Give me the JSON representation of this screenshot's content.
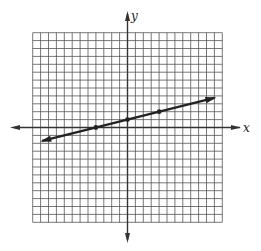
{
  "chart_data": {
    "type": "line",
    "title": "",
    "xlabel": "x",
    "ylabel": "y",
    "xlim": [
      -12,
      12
    ],
    "ylim": [
      -12,
      12
    ],
    "grid": true,
    "grid_step": 1,
    "arrows_on_axes": true,
    "series": [
      {
        "name": "line",
        "equation": "y = (1/4)x + 1",
        "slope": 0.25,
        "intercept": 1,
        "marked_points": [
          [
            -4,
            0
          ],
          [
            0,
            1
          ],
          [
            4,
            2
          ]
        ],
        "x_range": [
          -10.8,
          11
        ],
        "arrows_both_ends": true
      }
    ]
  },
  "colors": {
    "grid": "#555555",
    "axis": "#333333",
    "line": "#222222"
  }
}
